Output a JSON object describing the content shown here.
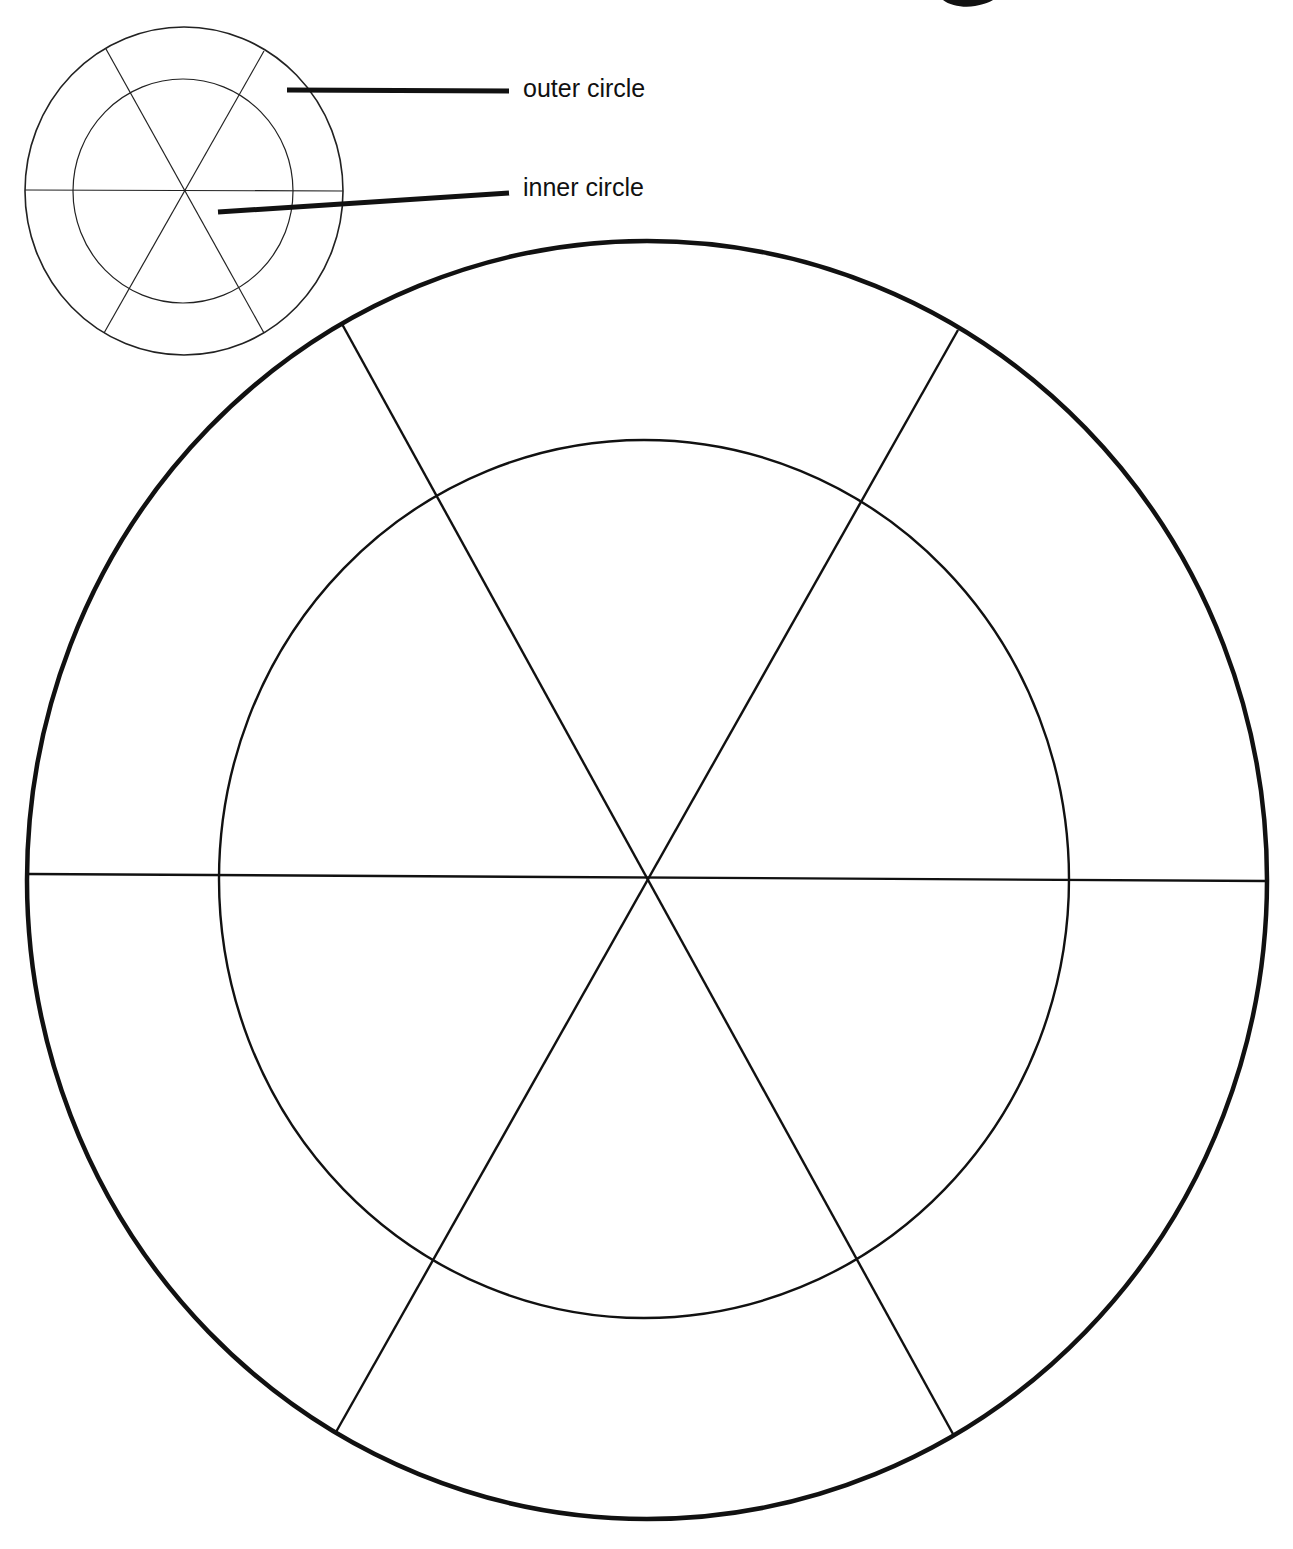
{
  "labels": {
    "outer": "outer circle",
    "inner": "inner circle"
  },
  "colors": {
    "background": "#ffffff",
    "ink": "#111111"
  },
  "legend_diagram": {
    "center": [
      184,
      191
    ],
    "outer_circle": {
      "rx": 159,
      "ry": 164
    },
    "inner_circle": {
      "rx": 110,
      "ry": 112
    },
    "segments": 6
  },
  "worksheet_wheel": {
    "center": [
      647,
      879
    ],
    "outer_circle": {
      "rx": 620,
      "ry": 639
    },
    "inner_circle": {
      "rx": 425,
      "ry": 439
    },
    "segments": 6
  }
}
